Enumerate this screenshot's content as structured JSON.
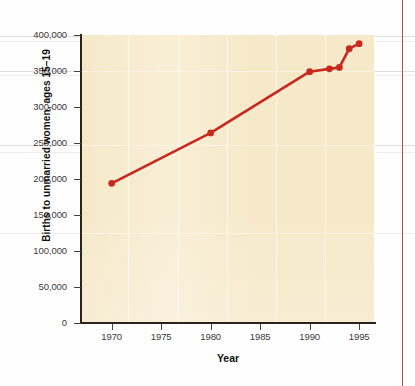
{
  "chart_data": {
    "type": "line",
    "title": "",
    "subtitle": "",
    "xlabel": "Year",
    "ylabel": "Births to unmarried women, ages 15–19",
    "xlim": [
      1967,
      1996.5
    ],
    "ylim": [
      0,
      400000
    ],
    "grid": true,
    "legend": false,
    "x_ticks": [
      1970,
      1975,
      1980,
      1985,
      1990,
      1995
    ],
    "x_tick_labels": [
      "1970",
      "1975",
      "1980",
      "1985",
      "1990",
      "1995"
    ],
    "y_ticks": [
      0,
      50000,
      100000,
      150000,
      200000,
      250000,
      300000,
      350000,
      400000
    ],
    "y_tick_labels": [
      "0",
      "50,000",
      "100,000",
      "150,000",
      "200,000",
      "250,000",
      "300,000",
      "350,000",
      "400,000"
    ],
    "series": [
      {
        "name": "Births to unmarried women, ages 15–19",
        "color": "#c8281e",
        "marker": "circle",
        "x": [
          1970,
          1980,
          1990,
          1992,
          1993,
          1994,
          1995
        ],
        "values": [
          194000,
          264000,
          349000,
          353000,
          355000,
          381000,
          388000
        ]
      }
    ]
  },
  "style": {
    "plot_background": "#f6e9c9",
    "line_color": "#c8281e",
    "axis_color": "#2c2419",
    "text_color": "#3a3a3a",
    "margin_rule_color": "#a8342f"
  }
}
